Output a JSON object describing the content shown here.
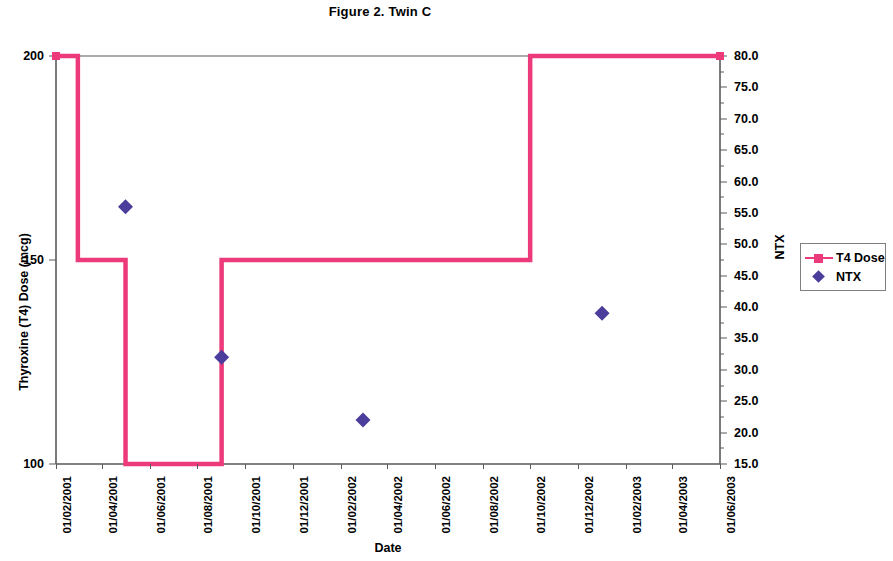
{
  "figure": {
    "title": "Figure 2.  Twin C"
  },
  "legend": {
    "position": "right",
    "items": [
      {
        "label": "T4 Dose",
        "marker": "line-square-marker-icon",
        "color": "#ED3A7A"
      },
      {
        "label": "NTX",
        "marker": "diamond-marker-icon",
        "color": "#4B3D9B"
      }
    ]
  },
  "axes": {
    "x": {
      "title": "Date",
      "ticks": [
        "01/02/2001",
        "01/04/2001",
        "01/06/2001",
        "01/08/2001",
        "01/10/2001",
        "01/12/2001",
        "01/02/2002",
        "01/04/2002",
        "01/06/2002",
        "01/08/2002",
        "01/10/2002",
        "01/12/2002",
        "01/02/2003",
        "01/04/2003",
        "01/06/2003"
      ]
    },
    "y_left": {
      "title": "Thyroxine (T4) Dose (mcg)",
      "ticks": [
        "100",
        "150",
        "200"
      ],
      "min": 100,
      "max": 200
    },
    "y_right": {
      "title": "NTX",
      "ticks": [
        "15.0",
        "20.0",
        "25.0",
        "30.0",
        "35.0",
        "40.0",
        "45.0",
        "50.0",
        "55.0",
        "60.0",
        "65.0",
        "70.0",
        "75.0",
        "80.0"
      ],
      "min": 15.0,
      "max": 80.0
    }
  },
  "chart_data": {
    "type": "line",
    "title": "Figure 2.  Twin C",
    "xlabel": "Date",
    "ylabel": "Thyroxine (T4) Dose (mcg)",
    "y2label": "NTX",
    "ylim": [
      100,
      200
    ],
    "y2lim": [
      15.0,
      80.0
    ],
    "grid": false,
    "legend_position": "right",
    "x_tick_labels": [
      "01/02/2001",
      "01/04/2001",
      "01/06/2001",
      "01/08/2001",
      "01/10/2001",
      "01/12/2001",
      "01/02/2002",
      "01/04/2002",
      "01/06/2002",
      "01/08/2002",
      "01/10/2002",
      "01/12/2002",
      "01/02/2003",
      "01/04/2003",
      "01/06/2003"
    ],
    "series": [
      {
        "name": "T4 Dose",
        "axis": "left",
        "style": "step",
        "color": "#ED3A7A",
        "points": [
          {
            "date": "01/02/2001",
            "value": 200
          },
          {
            "date": "01/03/2001",
            "value": 200
          },
          {
            "date": "01/03/2001",
            "value": 150
          },
          {
            "date": "01/05/2001",
            "value": 150
          },
          {
            "date": "01/05/2001",
            "value": 100
          },
          {
            "date": "01/09/2001",
            "value": 100
          },
          {
            "date": "01/09/2001",
            "value": 150
          },
          {
            "date": "01/10/2002",
            "value": 150
          },
          {
            "date": "01/10/2002",
            "value": 200
          },
          {
            "date": "01/06/2003",
            "value": 200
          }
        ]
      },
      {
        "name": "NTX",
        "axis": "right",
        "style": "scatter",
        "color": "#4B3D9B",
        "points": [
          {
            "date": "01/05/2001",
            "value": 56.0
          },
          {
            "date": "01/09/2001",
            "value": 32.0
          },
          {
            "date": "01/03/2002",
            "value": 22.0
          },
          {
            "date": "01/01/2003",
            "value": 39.0
          }
        ]
      }
    ]
  }
}
